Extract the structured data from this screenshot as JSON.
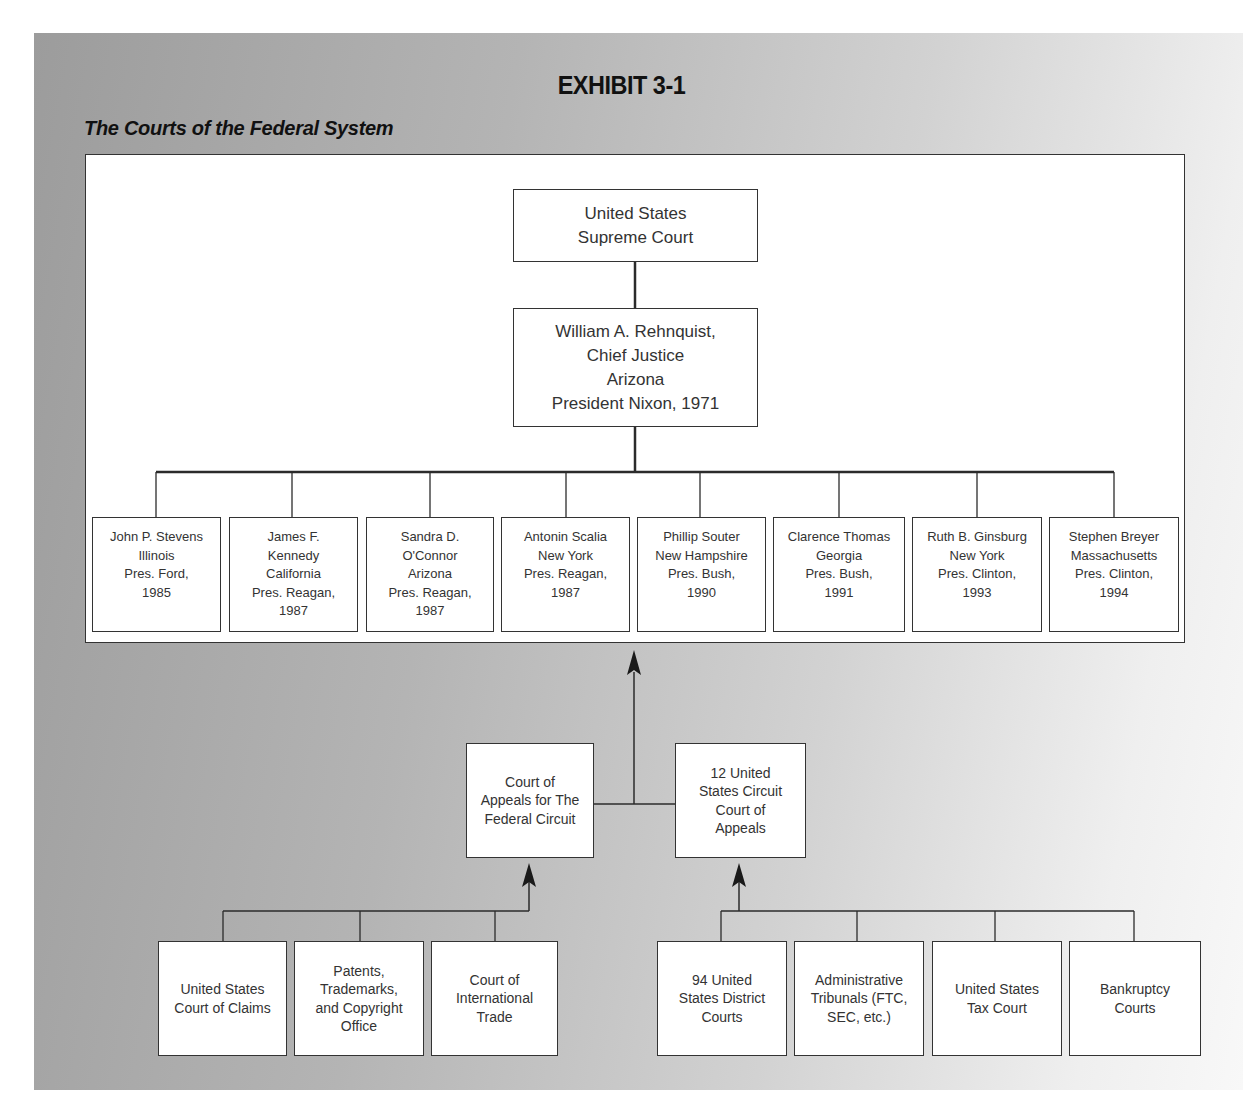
{
  "exhibit": {
    "title": "EXHIBIT 3-1",
    "subtitle": "The Courts of the Federal System"
  },
  "supreme_court": {
    "label": "United States\nSupreme Court"
  },
  "chief_justice": {
    "label": "William A. Rehnquist,\nChief Justice\nArizona\nPresident Nixon, 1971"
  },
  "associate_justices": [
    {
      "label": "John P. Stevens\nIllinois\nPres. Ford,\n1985"
    },
    {
      "label": "James F.\nKennedy\nCalifornia\nPres. Reagan,\n1987"
    },
    {
      "label": "Sandra D.\nO'Connor\nArizona\nPres. Reagan,\n1987"
    },
    {
      "label": "Antonin Scalia\nNew York\nPres. Reagan,\n1987"
    },
    {
      "label": "Phillip Souter\nNew Hampshire\nPres. Bush,\n1990"
    },
    {
      "label": "Clarence Thomas\nGeorgia\nPres. Bush,\n1991"
    },
    {
      "label": "Ruth B. Ginsburg\nNew York\nPres. Clinton,\n1993"
    },
    {
      "label": "Stephen Breyer\nMassachusetts\nPres. Clinton,\n1994"
    }
  ],
  "appellate_courts": [
    {
      "label": "Court of\nAppeals for The\nFederal Circuit"
    },
    {
      "label": "12 United\nStates Circuit\nCourt of\nAppeals"
    }
  ],
  "federal_circuit_sources": [
    {
      "label": "United States\nCourt of Claims"
    },
    {
      "label": "Patents,\nTrademarks,\nand Copyright\nOffice"
    },
    {
      "label": "Court of\nInternational\nTrade"
    }
  ],
  "circuit_sources": [
    {
      "label": "94 United\nStates District\nCourts"
    },
    {
      "label": "Administrative\nTribunals (FTC,\nSEC, etc.)"
    },
    {
      "label": "United States\nTax Court"
    },
    {
      "label": "Bankruptcy\nCourts"
    }
  ],
  "colors": {
    "line": "#2b2b2b",
    "box_border": "#333333",
    "panel_dark": "#9c9c9c",
    "panel_light": "#f8f8f8"
  }
}
